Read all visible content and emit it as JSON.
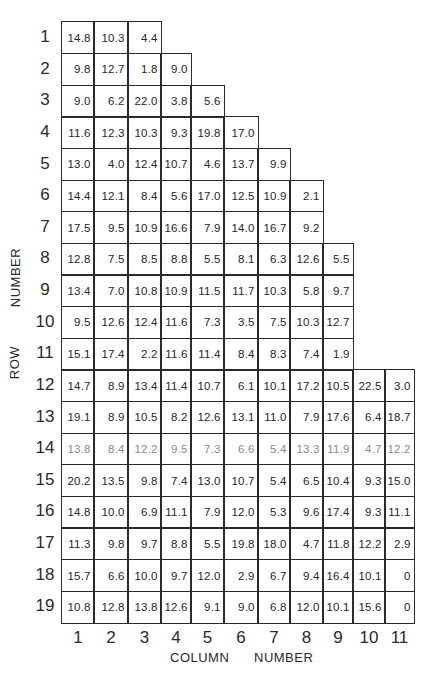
{
  "figure": {
    "x_axis_label_part1": "COLUMN",
    "x_axis_label_part2": "NUMBER",
    "y_axis_label_part1": "ROW",
    "y_axis_label_part2": "NUMBER",
    "row_labels": [
      "1",
      "2",
      "3",
      "4",
      "5",
      "6",
      "7",
      "8",
      "9",
      "10",
      "11",
      "12",
      "13",
      "14",
      "15",
      "16",
      "17",
      "18",
      "19"
    ],
    "column_labels": [
      "1",
      "2",
      "3",
      "4",
      "5",
      "6",
      "7",
      "8",
      "9",
      "10",
      "11"
    ],
    "rows": [
      [
        "14.8",
        "10.3",
        "4.4"
      ],
      [
        "9.8",
        "12.7",
        "1.8",
        "9.0"
      ],
      [
        "9.0",
        "6.2",
        "22.0",
        "3.8",
        "5.6"
      ],
      [
        "11.6",
        "12.3",
        "10.3",
        "9.3",
        "19.8",
        "17.0"
      ],
      [
        "13.0",
        "4.0",
        "12.4",
        "10.7",
        "4.6",
        "13.7",
        "9.9"
      ],
      [
        "14.4",
        "12.1",
        "8.4",
        "5.6",
        "17.0",
        "12.5",
        "10.9",
        "2.1"
      ],
      [
        "17.5",
        "9.5",
        "10.9",
        "16.6",
        "7.9",
        "14.0",
        "16.7",
        "9.2"
      ],
      [
        "12.8",
        "7.5",
        "8.5",
        "8.8",
        "5.5",
        "8.1",
        "6.3",
        "12.6",
        "5.5"
      ],
      [
        "13.4",
        "7.0",
        "10.8",
        "10.9",
        "11.5",
        "11.7",
        "10.3",
        "5.8",
        "9.7"
      ],
      [
        "9.5",
        "12.6",
        "12.4",
        "11.6",
        "7.3",
        "3.5",
        "7.5",
        "10.3",
        "12.7"
      ],
      [
        "15.1",
        "17.4",
        "2.2",
        "11.6",
        "11.4",
        "8.4",
        "8.3",
        "7.4",
        "1.9"
      ],
      [
        "14.7",
        "8.9",
        "13.4",
        "11.4",
        "10.7",
        "6.1",
        "10.1",
        "17.2",
        "10.5",
        "22.5",
        "3.0"
      ],
      [
        "19.1",
        "8.9",
        "10.5",
        "8.2",
        "12.6",
        "13.1",
        "11.0",
        "7.9",
        "17.6",
        "6.4",
        "18.7"
      ],
      [
        "13.8",
        "8.4",
        "12.2",
        "9.5",
        "7.3",
        "6.6",
        "5.4",
        "13.3",
        "11.9",
        "4.7",
        "12.2"
      ],
      [
        "20.2",
        "13.5",
        "9.8",
        "7.4",
        "13.0",
        "10.7",
        "5.4",
        "6.5",
        "10.4",
        "9.3",
        "15.0"
      ],
      [
        "14.8",
        "10.0",
        "6.9",
        "11.1",
        "7.9",
        "12.0",
        "5.3",
        "9.6",
        "17.4",
        "9.3",
        "11.1"
      ],
      [
        "11.3",
        "9.8",
        "9.7",
        "8.8",
        "5.5",
        "19.8",
        "18.0",
        "4.7",
        "11.8",
        "12.2",
        "2.9"
      ],
      [
        "15.7",
        "6.6",
        "10.0",
        "9.7",
        "12.0",
        "2.9",
        "6.7",
        "9.4",
        "16.4",
        "10.1",
        "0"
      ],
      [
        "10.8",
        "12.8",
        "13.8",
        "12.6",
        "9.1",
        "9.0",
        "6.8",
        "12.0",
        "10.1",
        "15.6",
        "0"
      ]
    ]
  }
}
